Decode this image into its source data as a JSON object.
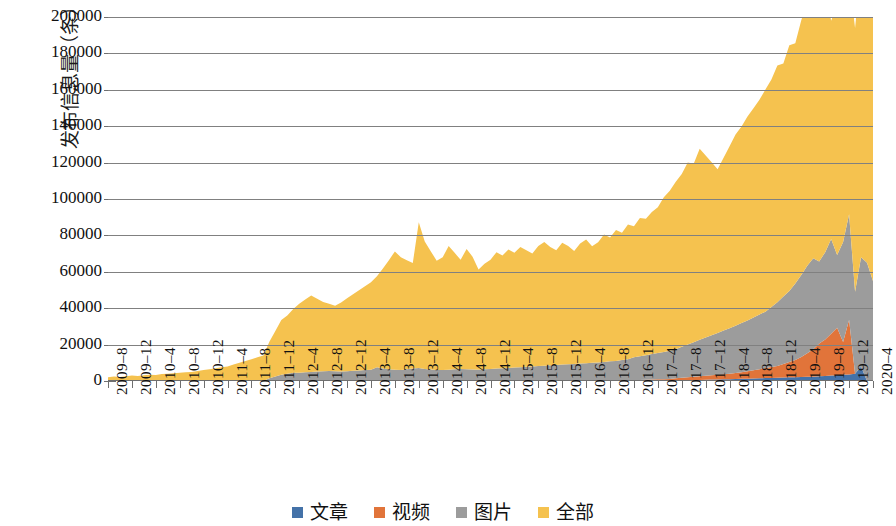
{
  "chart_data": {
    "type": "area",
    "stacked": true,
    "title": "",
    "xlabel": "",
    "ylabel": "发布信息量（条）",
    "ylim": [
      0,
      200000
    ],
    "ytick_step": 20000,
    "ytick_labels": [
      "200000",
      "180000",
      "160000",
      "140000",
      "120000",
      "100000",
      "80000",
      "60000",
      "40000",
      "20000",
      "0"
    ],
    "grid": true,
    "legend_position": "bottom",
    "x_tick_labels": [
      "2009–8",
      "2009–12",
      "2010–4",
      "2010–8",
      "2010–12",
      "2011–4",
      "2011–8",
      "2011–12",
      "2012–4",
      "2012–8",
      "2012–12",
      "2013–4",
      "2013–8",
      "2013–12",
      "2014–4",
      "2014–8",
      "2014–12",
      "2015–4",
      "2015–8",
      "2015–12",
      "2016–4",
      "2016–8",
      "2016–12",
      "2017–4",
      "2017–8",
      "2017–12",
      "2018–4",
      "2018–8",
      "2018–12",
      "2019–4",
      "2019–8",
      "2019–12",
      "2020–4"
    ],
    "x_tick_interval_months": 4,
    "x_start": "2009-8",
    "x_end": "2020-4",
    "colors": {
      "文章": "#4472A8",
      "视频": "#E1743A",
      "图片": "#9C9C9C",
      "全部": "#F5C24F"
    },
    "series": [
      {
        "name": "文章",
        "color": "#4472A8",
        "values": [
          0,
          0,
          0,
          0,
          0,
          0,
          0,
          0,
          0,
          0,
          0,
          0,
          0,
          0,
          0,
          0,
          0,
          0,
          0,
          0,
          0,
          0,
          0,
          0,
          0,
          0,
          0,
          0,
          0,
          0,
          0,
          0,
          0,
          0,
          0,
          0,
          0,
          0,
          0,
          0,
          0,
          0,
          0,
          0,
          0,
          0,
          0,
          0,
          0,
          0,
          0,
          0,
          0,
          0,
          0,
          0,
          0,
          0,
          0,
          0,
          0,
          0,
          0,
          0,
          0,
          0,
          0,
          0,
          0,
          0,
          0,
          0,
          0,
          0,
          0,
          0,
          0,
          0,
          0,
          0,
          0,
          0,
          0,
          0,
          0,
          0,
          0,
          0,
          0,
          0,
          0,
          0,
          0,
          0,
          0,
          300,
          400,
          500,
          500,
          600,
          700,
          800,
          800,
          900,
          1000,
          1100,
          1200,
          1300,
          1400,
          1500,
          1600,
          1700,
          1800,
          1900,
          2000,
          2100,
          2200,
          2300,
          2400,
          2600,
          2800,
          3000,
          3200,
          3400,
          3600,
          4000,
          8000
        ]
      },
      {
        "name": "视频",
        "color": "#E1743A",
        "values": [
          0,
          0,
          0,
          0,
          0,
          0,
          0,
          0,
          0,
          0,
          0,
          0,
          0,
          0,
          0,
          0,
          0,
          0,
          0,
          0,
          0,
          0,
          0,
          0,
          0,
          0,
          0,
          0,
          0,
          0,
          0,
          0,
          0,
          0,
          0,
          0,
          0,
          0,
          0,
          0,
          0,
          0,
          0,
          0,
          0,
          0,
          0,
          0,
          0,
          0,
          0,
          0,
          0,
          0,
          0,
          0,
          0,
          0,
          0,
          0,
          0,
          0,
          0,
          0,
          0,
          0,
          0,
          0,
          0,
          0,
          0,
          0,
          0,
          0,
          0,
          0,
          0,
          0,
          0,
          0,
          0,
          0,
          0,
          0,
          0,
          0,
          0,
          0,
          500,
          600,
          700,
          800,
          900,
          1000,
          1100,
          1200,
          1400,
          1600,
          1800,
          2000,
          2200,
          2400,
          2600,
          2800,
          3000,
          3300,
          3600,
          4000,
          4500,
          5000,
          5500,
          6000,
          6500,
          7500,
          8500,
          9500,
          11000,
          13000,
          15000,
          18000,
          20000,
          23000,
          26000,
          18000,
          30000
        ]
      },
      {
        "name": "图片",
        "color": "#9C9C9C",
        "values": [
          0,
          0,
          0,
          0,
          0,
          0,
          0,
          0,
          0,
          0,
          0,
          0,
          0,
          0,
          0,
          0,
          0,
          0,
          0,
          0,
          0,
          0,
          0,
          0,
          0,
          0,
          0,
          1500,
          2500,
          3500,
          4000,
          4500,
          4500,
          4800,
          5000,
          5200,
          5400,
          5500,
          5300,
          5200,
          5400,
          5600,
          5800,
          6000,
          6200,
          7500,
          6800,
          6400,
          6200,
          6000,
          6400,
          6800,
          7200,
          6600,
          6300,
          6100,
          6000,
          6200,
          6400,
          6600,
          6500,
          6300,
          6200,
          6400,
          6600,
          6800,
          7000,
          7200,
          7400,
          7600,
          7800,
          8000,
          8200,
          8400,
          8600,
          8800,
          9000,
          9200,
          9400,
          9600,
          9800,
          10000,
          10200,
          10500,
          10800,
          11000,
          11500,
          12000,
          12500,
          13000,
          13500,
          14000,
          14500,
          15000,
          15500,
          16000,
          17000,
          18000,
          19000,
          20000,
          21000,
          22000,
          23000,
          24000,
          25000,
          26000,
          27000,
          28000,
          29000,
          30000,
          31000,
          33000,
          35000,
          37000,
          39000,
          42000,
          45000,
          48000,
          50000,
          45000,
          48000,
          52000,
          40000,
          55000,
          58000,
          45000,
          60000,
          65000,
          55000,
          70000
        ]
      },
      {
        "name": "全部",
        "color": "#F5C24F",
        "values": [
          2000,
          2500,
          2200,
          2600,
          3000,
          2800,
          3200,
          3500,
          3300,
          3800,
          4000,
          4200,
          4500,
          4800,
          5000,
          5500,
          6000,
          6500,
          7000,
          7500,
          8000,
          9000,
          10000,
          11000,
          12000,
          13000,
          14000,
          20000,
          25000,
          30000,
          32000,
          35000,
          38000,
          40000,
          42000,
          40000,
          38000,
          37000,
          36000,
          38000,
          40000,
          42000,
          44000,
          46000,
          48000,
          50000,
          55000,
          60000,
          65000,
          62000,
          60000,
          58000,
          80000,
          70000,
          65000,
          60000,
          62000,
          68000,
          64000,
          60000,
          66000,
          62000,
          55000,
          58000,
          60000,
          64000,
          62000,
          65000,
          63000,
          66000,
          64000,
          62000,
          66000,
          68000,
          65000,
          63000,
          67000,
          65000,
          62000,
          66000,
          68000,
          64000,
          66000,
          70000,
          68000,
          72000,
          70000,
          74000,
          72000,
          76000,
          75000,
          78000,
          80000,
          85000,
          88000,
          92000,
          95000,
          100000,
          98000,
          105000,
          100000,
          95000,
          90000,
          95000,
          100000,
          105000,
          108000,
          112000,
          115000,
          118000,
          122000,
          125000,
          130000,
          128000,
          135000,
          132000,
          140000,
          145000,
          138000,
          150000,
          145000,
          120000,
          138000,
          155000,
          130000,
          145000,
          160000,
          150000,
          187000
        ]
      }
    ],
    "series_note": "Stacked area chart; 全部 (All) is the top band, 图片 (Images) beneath it, 视频 (Video) beneath that, 文章 (Articles) at the bottom."
  },
  "legend": {
    "items": [
      {
        "label": "文章",
        "color": "#4472A8"
      },
      {
        "label": "视频",
        "color": "#E1743A"
      },
      {
        "label": "图片",
        "color": "#9C9C9C"
      },
      {
        "label": "全部",
        "color": "#F5C24F"
      }
    ]
  },
  "axes": {
    "y_title": "发布信息量（条）"
  }
}
